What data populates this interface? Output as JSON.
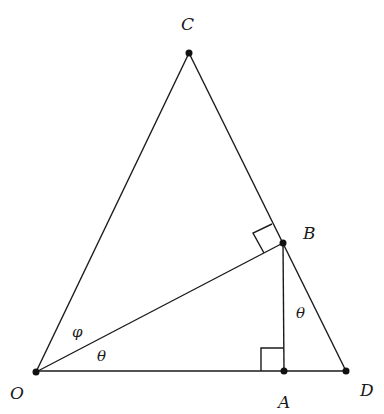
{
  "diagram": {
    "type": "geometry",
    "points": [
      {
        "id": "O",
        "label": "O",
        "x": 36,
        "y": 372,
        "label_x": 12,
        "label_y": 398
      },
      {
        "id": "A",
        "label": "A",
        "x": 284,
        "y": 371,
        "label_x": 278,
        "label_y": 408
      },
      {
        "id": "D",
        "label": "D",
        "x": 346,
        "y": 371,
        "label_x": 360,
        "label_y": 396
      },
      {
        "id": "B",
        "label": "B",
        "x": 283,
        "y": 243,
        "label_x": 304,
        "label_y": 240
      },
      {
        "id": "C",
        "label": "C",
        "x": 189,
        "y": 53,
        "label_x": 182,
        "label_y": 30
      }
    ],
    "segments": [
      "O-C",
      "C-D",
      "O-D",
      "O-B",
      "B-A"
    ],
    "right_angles": [
      "O-B-C (at B)",
      "O-A-B (at A)"
    ],
    "angle_labels": [
      {
        "id": "phi",
        "text": "φ",
        "x": 72,
        "y": 336
      },
      {
        "id": "theta-O",
        "text": "θ",
        "x": 96,
        "y": 360
      },
      {
        "id": "theta-B",
        "text": "θ",
        "x": 296,
        "y": 318
      }
    ]
  }
}
